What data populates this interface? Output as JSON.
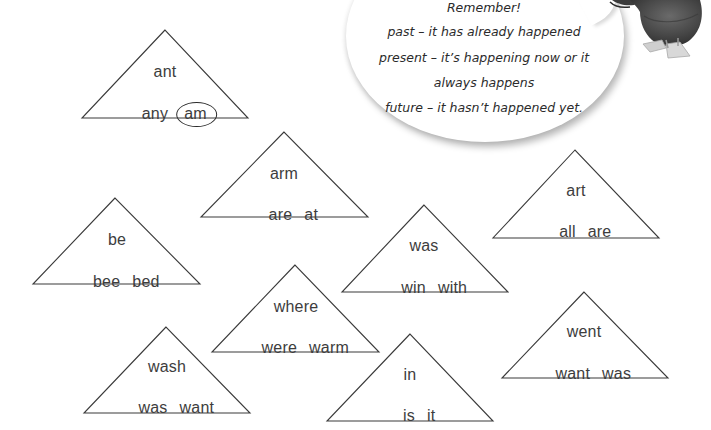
{
  "bubble": {
    "lines": [
      "Remember!",
      "past – it has already happened",
      "present – it’s happening now or it",
      "always happens",
      "future – it hasn’t happened yet."
    ]
  },
  "triangles": [
    {
      "top": "ant",
      "bottom": [
        "any",
        "am"
      ],
      "circled": "am"
    },
    {
      "top": "arm",
      "bottom": [
        "are",
        "at"
      ]
    },
    {
      "top": "be",
      "bottom": [
        "bee",
        "bed"
      ]
    },
    {
      "top": "was",
      "bottom": [
        "win",
        "with"
      ]
    },
    {
      "top": "art",
      "bottom": [
        "all",
        "are"
      ]
    },
    {
      "top": "where",
      "bottom": [
        "were",
        "warm"
      ]
    },
    {
      "top": "wash",
      "bottom": [
        "was",
        "want"
      ]
    },
    {
      "top": "in",
      "bottom": [
        "is",
        "it"
      ]
    },
    {
      "top": "went",
      "bottom": [
        "want",
        "was"
      ]
    }
  ],
  "colors": {
    "triangle_stroke": "#3a3a3a",
    "word_text": "#3d3d3d",
    "bubble_text": "#2b2b2b",
    "bird_body": "#4a4a4a",
    "bird_feet": "#c8c8c8"
  }
}
